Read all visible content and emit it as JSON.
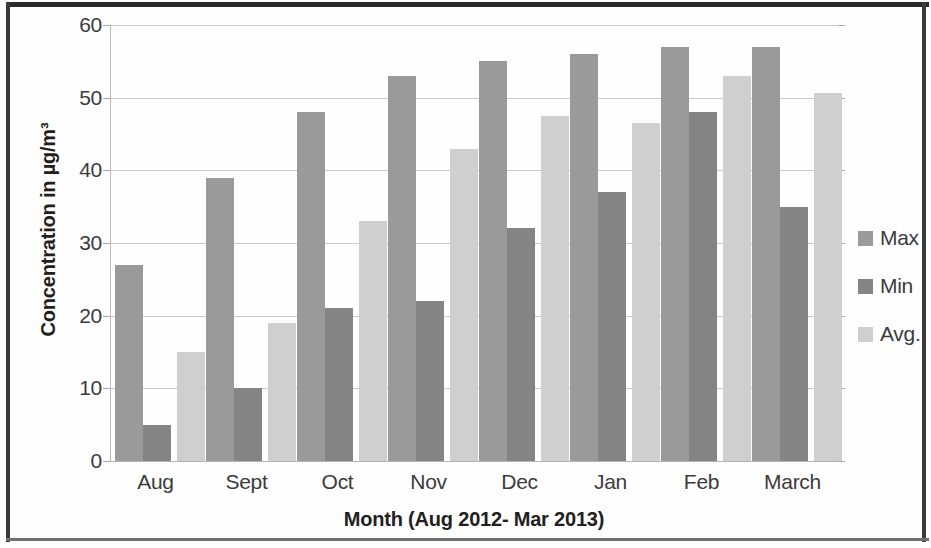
{
  "chart_data": {
    "type": "bar",
    "title": "",
    "xlabel": "Month (Aug 2012- Mar 2013)",
    "ylabel": "Concentration in µg/m³",
    "categories": [
      "Aug",
      "Sept",
      "Oct",
      "Nov",
      "Dec",
      "Jan",
      "Feb",
      "March"
    ],
    "series": [
      {
        "name": "Max",
        "values": [
          27,
          39,
          48,
          53,
          55,
          56,
          57,
          57
        ]
      },
      {
        "name": "Min",
        "values": [
          5,
          10,
          21,
          22,
          32,
          37,
          48,
          35
        ]
      },
      {
        "name": "Avg.",
        "values": [
          15,
          19,
          33,
          43,
          47.5,
          46.5,
          53,
          50.7
        ]
      }
    ],
    "ylim": [
      0,
      60
    ],
    "yticks": [
      0,
      10,
      20,
      30,
      40,
      50,
      60
    ],
    "ytick_labels": [
      "0",
      "10",
      "20",
      "30",
      "40",
      "50",
      "60"
    ],
    "grid": true,
    "legend_position": "right",
    "colors": {
      "max": "#9a9a9a",
      "min": "#848484",
      "avg": "#cfcfcf",
      "gridline": "#c9c9c9",
      "axis": "#b9b9b9",
      "text": "#3b3b3b",
      "title_text": "#231f20",
      "frame": "#2a2a2a",
      "background": "#ffffff"
    }
  },
  "legend": {
    "items": [
      {
        "label": "Max",
        "color": "#9a9a9a"
      },
      {
        "label": "Min",
        "color": "#848484"
      },
      {
        "label": "Avg.",
        "color": "#cfcfcf"
      }
    ]
  }
}
